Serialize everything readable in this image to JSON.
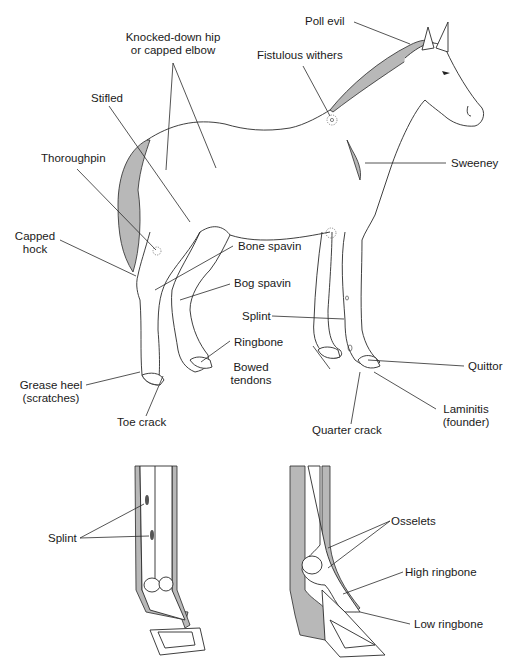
{
  "figure": {
    "colors": {
      "line": "#2a2a2a",
      "shade": "#b8b8b8",
      "background": "#ffffff"
    }
  },
  "labels": {
    "poll_evil": "Poll evil",
    "fistulous_withers": "Fistulous withers",
    "knocked_down_hip_line1": "Knocked-down hip",
    "knocked_down_hip_line2": "or capped elbow",
    "stifled": "Stifled",
    "thoroughpin": "Thoroughpin",
    "sweeney": "Sweeney",
    "capped_hock_line1": "Capped",
    "capped_hock_line2": "hock",
    "bone_spavin": "Bone spavin",
    "bog_spavin": "Bog spavin",
    "splint": "Splint",
    "ringbone": "Ringbone",
    "bowed_tendons_line1": "Bowed",
    "bowed_tendons_line2": "tendons",
    "quittor": "Quittor",
    "grease_heel_line1": "Grease heel",
    "grease_heel_line2": "(scratches)",
    "toe_crack": "Toe crack",
    "quarter_crack": "Quarter crack",
    "laminitis_line1": "Laminitis",
    "laminitis_line2": "(founder)"
  },
  "insets": {
    "front_leg": {
      "splint": "Splint"
    },
    "side_leg": {
      "osselets": "Osselets",
      "high_ringbone": "High ringbone",
      "low_ringbone": "Low ringbone"
    }
  }
}
